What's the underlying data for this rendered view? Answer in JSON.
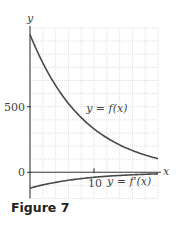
{
  "caption": "Figure 7",
  "chart_data": {
    "type": "line",
    "title": "",
    "xlabel": "x",
    "ylabel": "y",
    "xlim": [
      0,
      20
    ],
    "ylim": [
      -200,
      1100
    ],
    "grid": true,
    "x_ticks": [
      {
        "value": 10,
        "label": "10"
      }
    ],
    "y_ticks": [
      {
        "value": 0,
        "label": "0"
      },
      {
        "value": 500,
        "label": "500"
      }
    ],
    "x_grid_step": 2,
    "y_grid_step": 100,
    "x": [
      0,
      2,
      4,
      6,
      8,
      10,
      12,
      14,
      16,
      18,
      20
    ],
    "series": [
      {
        "name": "y = f(x)",
        "values": [
          1050,
          834,
          662,
          525,
          417,
          331,
          263,
          209,
          166,
          131,
          104
        ]
      },
      {
        "name": "y = f'(x)",
        "values": [
          -121,
          -96,
          -77,
          -61,
          -48,
          -38,
          -30,
          -24,
          -19,
          -15,
          -12
        ]
      }
    ],
    "annotations": [
      {
        "text": "y = f(x)",
        "x": 12,
        "y": 460
      },
      {
        "text": "y = f'(x)",
        "x": 15.5,
        "y": -95
      }
    ]
  }
}
